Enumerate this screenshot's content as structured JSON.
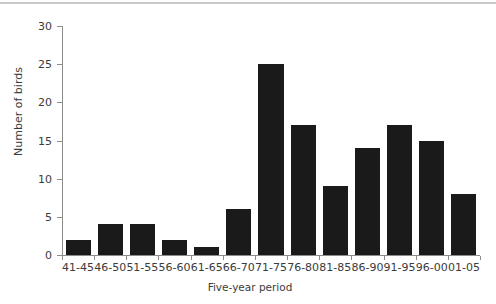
{
  "chart_data": {
    "type": "bar",
    "title": "",
    "xlabel": "Five-year period",
    "ylabel": "Number of birds",
    "categories": [
      "41-45",
      "46-50",
      "51-55",
      "56-60",
      "61-65",
      "66-70",
      "71-75",
      "76-80",
      "81-85",
      "86-90",
      "91-95",
      "96-00",
      "01-05"
    ],
    "values": [
      2,
      4,
      4,
      2,
      1,
      6,
      25,
      17,
      9,
      14,
      17,
      15,
      8
    ],
    "ylim": [
      0,
      30
    ],
    "yticks": [
      0,
      5,
      10,
      15,
      20,
      25,
      30
    ],
    "ytick_labels": [
      "0",
      "5",
      "10",
      "15",
      "20",
      "25",
      "30"
    ],
    "grid": false,
    "legend": null,
    "bar_color": "#1a1a1a",
    "axis_color": "#8c8c8c",
    "text_color": "#3b3b3b",
    "background": "#ffffff"
  }
}
